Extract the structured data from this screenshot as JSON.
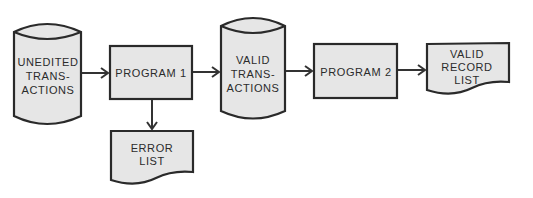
{
  "diagram": {
    "type": "system-flowchart",
    "colors": {
      "fill": "#e6e6e6",
      "stroke": "#2a2a2a",
      "text": "#2b2b2b",
      "background": "#ffffff"
    },
    "nodes": [
      {
        "id": "unedited",
        "shape": "cylinder",
        "lines": [
          "UNEDITED",
          "TRANS-",
          "ACTIONS"
        ]
      },
      {
        "id": "program1",
        "shape": "process",
        "lines": [
          "PROGRAM 1"
        ]
      },
      {
        "id": "errorlist",
        "shape": "document",
        "lines": [
          "ERROR",
          "LIST"
        ]
      },
      {
        "id": "valid",
        "shape": "cylinder",
        "lines": [
          "VALID",
          "TRANS-",
          "ACTIONS"
        ]
      },
      {
        "id": "program2",
        "shape": "process",
        "lines": [
          "PROGRAM 2"
        ]
      },
      {
        "id": "recordlist",
        "shape": "document",
        "lines": [
          "VALID",
          "RECORD",
          "LIST"
        ]
      }
    ],
    "edges": [
      {
        "from": "unedited",
        "to": "program1"
      },
      {
        "from": "program1",
        "to": "errorlist"
      },
      {
        "from": "program1",
        "to": "valid"
      },
      {
        "from": "valid",
        "to": "program2"
      },
      {
        "from": "program2",
        "to": "recordlist"
      }
    ]
  }
}
